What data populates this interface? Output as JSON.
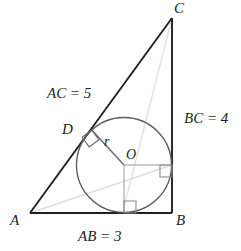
{
  "figure": {
    "type": "geometry-diagram",
    "colors": {
      "stroke_dark": "#231f20",
      "stroke_faint": "#d8d8d8",
      "stroke_medium": "#8a8a8a",
      "background": "#ffffff"
    },
    "vertices": {
      "a": {
        "label": "A",
        "x": 30,
        "y": 213
      },
      "b": {
        "label": "B",
        "x": 172,
        "y": 213
      },
      "c": {
        "label": "C",
        "x": 172,
        "y": 18
      }
    },
    "incircle": {
      "center_label": "O",
      "center_x": 124,
      "center_y": 165,
      "radius": 47.5,
      "radius_label": "r"
    },
    "tangent_point_ac": {
      "label": "D",
      "x": 92,
      "y": 135
    },
    "side_labels": [
      {
        "name": "ac-label",
        "text": "AC = 5",
        "x": 47,
        "y": 86
      },
      {
        "name": "bc-label",
        "text": "BC = 4",
        "x": 184,
        "y": 111
      },
      {
        "name": "ab-label",
        "text": "AB = 3",
        "x": 78,
        "y": 229
      }
    ],
    "measurements": {
      "ab": 3,
      "bc": 4,
      "ac": 5,
      "inradius": 1
    },
    "right_angle_markers": [
      {
        "name": "right-angle-at-d",
        "at": "D on AC"
      },
      {
        "name": "right-angle-at-bc-tangent",
        "at": "tangent point on BC"
      },
      {
        "name": "right-angle-at-ab-tangent",
        "at": "tangent point on AB"
      }
    ]
  }
}
